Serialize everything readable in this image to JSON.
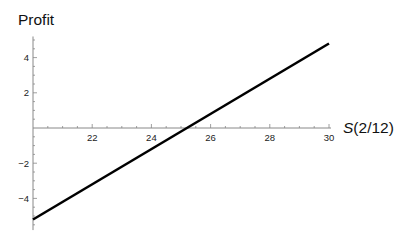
{
  "chart_data": {
    "type": "line",
    "title": "",
    "xlabel": "S(2/12)",
    "xlabel_italic_part": "S",
    "xlabel_rest": "(2/12)",
    "ylabel": "Profit",
    "xlim": [
      20,
      30
    ],
    "ylim": [
      -5.8,
      5.2
    ],
    "x_ticks": [
      22,
      24,
      26,
      28,
      30
    ],
    "x_tick_labels": [
      "22",
      "24",
      "26",
      "28",
      "30"
    ],
    "y_ticks": [
      -4,
      -2,
      2,
      4
    ],
    "y_tick_labels": [
      "−4",
      "−2",
      "2",
      "4"
    ],
    "minor_tick_step": 0.5,
    "grid": false,
    "legend": null,
    "series": [
      {
        "name": "Profit",
        "color": "#000000",
        "x": [
          20,
          30
        ],
        "y": [
          -5.2,
          4.8
        ]
      }
    ]
  }
}
